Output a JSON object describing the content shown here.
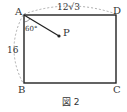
{
  "figure": {
    "caption": "図 2",
    "vertices": {
      "A": "A",
      "B": "B",
      "C": "C",
      "D": "D",
      "P": "P"
    },
    "dimensions": {
      "AD": "12√3",
      "AB": "16"
    },
    "angle": "60°",
    "colors": {
      "line": "#222222",
      "dashed": "#888888",
      "text": "#333333"
    }
  }
}
